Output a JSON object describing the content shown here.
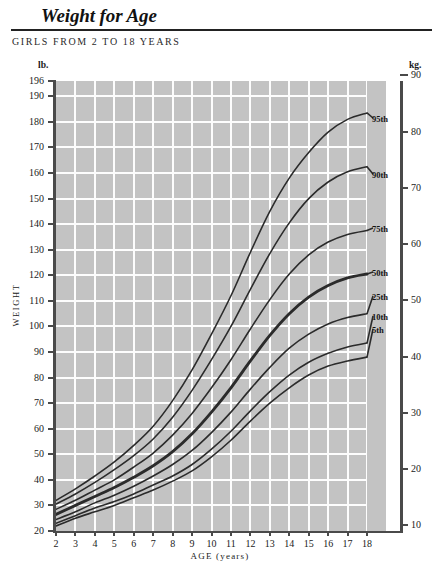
{
  "header": {
    "title": "Weight for Age",
    "subtitle": "GIRLS FROM 2 TO 18 YEARS"
  },
  "units": {
    "left": "lb.",
    "right": "kg."
  },
  "axes": {
    "y_left_title": "WEIGHT",
    "x_title": "AGE (years)",
    "y_left_ticks": [
      "20",
      "30",
      "40",
      "50",
      "60",
      "70",
      "80",
      "90",
      "100",
      "110",
      "120",
      "130",
      "140",
      "150",
      "160",
      "170",
      "180",
      "190",
      "196"
    ],
    "y_right_ticks": [
      "10",
      "20",
      "30",
      "40",
      "50",
      "60",
      "70",
      "80",
      "90"
    ],
    "x_ticks": [
      "2",
      "3",
      "4",
      "5",
      "6",
      "7",
      "8",
      "9",
      "10",
      "11",
      "12",
      "13",
      "14",
      "15",
      "16",
      "17",
      "18"
    ]
  },
  "colors": {
    "plot_background": "#c3c3c3",
    "gridline": "#fdfdfd",
    "curve": "#2b2b2b",
    "axis": "#4a4a4a",
    "page_background": "#ffffff"
  },
  "percentile_labels": [
    "95th",
    "90th",
    "75th",
    "50th",
    "25th",
    "10th",
    "5th"
  ],
  "chart_data": {
    "type": "line",
    "title": "Weight for Age",
    "subtitle": "GIRLS FROM 2 TO 18 YEARS",
    "xlabel": "AGE (years)",
    "ylabel": "WEIGHT",
    "y_unit_left": "lb.",
    "y_unit_right": "kg.",
    "xlim": [
      2,
      18
    ],
    "ylim_lb": [
      20,
      196
    ],
    "ylim_kg": [
      9,
      89
    ],
    "grid": true,
    "legend_position": "right-inline-labels",
    "x": [
      2,
      3,
      4,
      5,
      6,
      7,
      8,
      9,
      10,
      11,
      12,
      13,
      14,
      15,
      16,
      17,
      18
    ],
    "series": [
      {
        "name": "95th",
        "emphasis": "normal",
        "values_lb": [
          32.0,
          36.5,
          41.5,
          47.0,
          53.5,
          61.0,
          71.0,
          83.0,
          97.0,
          112.0,
          129.0,
          145.0,
          158.0,
          168.0,
          176.0,
          181.0,
          183.5
        ]
      },
      {
        "name": "90th",
        "emphasis": "normal",
        "values_lb": [
          30.5,
          34.5,
          39.0,
          44.0,
          49.5,
          56.0,
          64.5,
          75.0,
          87.0,
          100.0,
          114.5,
          128.5,
          140.5,
          150.0,
          156.5,
          160.5,
          162.5
        ]
      },
      {
        "name": "75th",
        "emphasis": "normal",
        "values_lb": [
          28.5,
          32.0,
          36.0,
          40.0,
          45.0,
          50.5,
          57.5,
          66.0,
          76.0,
          87.0,
          99.0,
          110.5,
          120.5,
          128.0,
          133.0,
          136.0,
          137.5
        ]
      },
      {
        "name": "50th",
        "emphasis": "bold",
        "values_lb": [
          26.5,
          30.0,
          33.5,
          37.0,
          41.0,
          45.5,
          51.0,
          58.0,
          66.5,
          76.0,
          86.5,
          96.5,
          105.0,
          111.5,
          116.0,
          119.0,
          120.5
        ]
      },
      {
        "name": "25th",
        "emphasis": "normal",
        "values_lb": [
          24.5,
          27.5,
          31.0,
          34.0,
          37.5,
          41.5,
          46.0,
          51.5,
          58.5,
          66.5,
          75.5,
          84.0,
          91.5,
          97.0,
          101.0,
          103.5,
          105.0
        ]
      },
      {
        "name": "10th",
        "emphasis": "normal",
        "values_lb": [
          23.0,
          26.0,
          29.0,
          31.5,
          34.5,
          38.0,
          41.5,
          46.0,
          52.0,
          59.0,
          67.0,
          74.5,
          81.0,
          86.0,
          89.5,
          92.0,
          93.5
        ]
      },
      {
        "name": "5th",
        "emphasis": "normal",
        "values_lb": [
          22.0,
          25.0,
          27.5,
          30.0,
          33.0,
          36.0,
          39.5,
          43.5,
          49.0,
          55.5,
          63.0,
          70.0,
          76.0,
          81.0,
          84.5,
          86.5,
          88.0
        ]
      }
    ]
  }
}
